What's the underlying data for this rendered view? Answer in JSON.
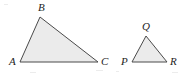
{
  "figure": {
    "type": "geometry-diagram",
    "background_color": "#ffffff",
    "fill_color": "#ebebeb",
    "stroke_color": "#4a4a4a",
    "label_color": "#242424",
    "shapes": [
      {
        "name": "triangle-abc",
        "points": "20,62 40,17 98,62",
        "vertices": [
          {
            "label": "A",
            "x": 20,
            "y": 62,
            "label_x": 9,
            "label_y": 56
          },
          {
            "label": "B",
            "x": 40,
            "y": 17,
            "label_x": 38,
            "label_y": 2
          },
          {
            "label": "C",
            "x": 98,
            "y": 62,
            "label_x": 101,
            "label_y": 56
          }
        ]
      },
      {
        "name": "triangle-pqr",
        "points": "132,62 146,36 167,62",
        "vertices": [
          {
            "label": "P",
            "x": 132,
            "y": 62,
            "label_x": 121,
            "label_y": 56
          },
          {
            "label": "Q",
            "x": 146,
            "y": 36,
            "label_x": 142,
            "label_y": 21
          },
          {
            "label": "R",
            "x": 167,
            "y": 62,
            "label_x": 170,
            "label_y": 56
          }
        ]
      }
    ]
  }
}
